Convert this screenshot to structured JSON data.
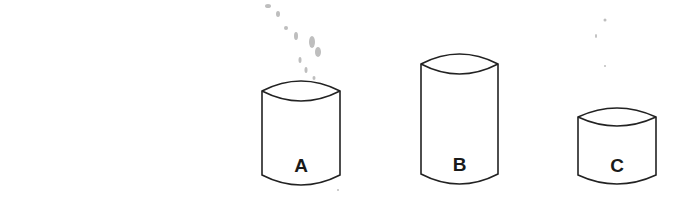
{
  "diagram": {
    "colors": {
      "stroke": "#222222",
      "background": "#ffffff",
      "specks": "#8a8a8a"
    },
    "containers": [
      {
        "id": "A",
        "label": "A",
        "left": 262,
        "right": 340,
        "top": 91,
        "bottom": 175,
        "bulge": 10
      },
      {
        "id": "B",
        "label": "B",
        "left": 421,
        "right": 498,
        "top": 64,
        "bottom": 174,
        "bulge": 10
      },
      {
        "id": "C",
        "label": "C",
        "left": 578,
        "right": 656,
        "top": 117,
        "bottom": 175,
        "bulge": 9
      }
    ]
  }
}
